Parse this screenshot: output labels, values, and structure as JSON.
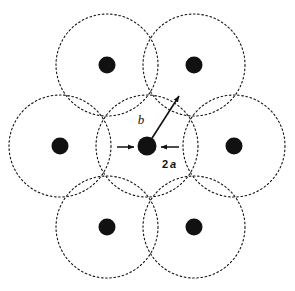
{
  "figure": {
    "background_color": "#ffffff",
    "stroke_color": "#111111",
    "dot_fill_color": "#111111"
  },
  "geometry": {
    "cell_radius": 51,
    "dot_radius": 8.5,
    "dash_pattern": "1.6 2.6",
    "circle_stroke_width": 1.1
  },
  "circles": [
    {
      "name": "circle-top-left",
      "cx": 107,
      "cy": 65,
      "r": 51
    },
    {
      "name": "circle-top-right",
      "cx": 194,
      "cy": 65,
      "r": 51
    },
    {
      "name": "circle-middle-left",
      "cx": 60,
      "cy": 146,
      "r": 51
    },
    {
      "name": "circle-center",
      "cx": 147,
      "cy": 146,
      "r": 51
    },
    {
      "name": "circle-middle-right",
      "cx": 234,
      "cy": 146,
      "r": 51
    },
    {
      "name": "circle-bottom-left",
      "cx": 107,
      "cy": 227,
      "r": 51
    },
    {
      "name": "circle-bottom-right",
      "cx": 194,
      "cy": 227,
      "r": 51
    }
  ],
  "dots": [
    {
      "name": "dot-top-left",
      "cx": 107,
      "cy": 65,
      "r": 8.5
    },
    {
      "name": "dot-top-right",
      "cx": 194,
      "cy": 65,
      "r": 8.5
    },
    {
      "name": "dot-middle-left",
      "cx": 60,
      "cy": 146,
      "r": 8.5
    },
    {
      "name": "dot-center",
      "cx": 147,
      "cy": 146,
      "r": 9.5
    },
    {
      "name": "dot-middle-right",
      "cx": 234,
      "cy": 146,
      "r": 8.5
    },
    {
      "name": "dot-bottom-left",
      "cx": 107,
      "cy": 227,
      "r": 8.5
    },
    {
      "name": "dot-bottom-right",
      "cx": 194,
      "cy": 227,
      "r": 8.5
    }
  ],
  "annotations": {
    "radius_arrow": {
      "label": "b",
      "label_x": 141,
      "label_y": 124,
      "from_x": 147,
      "from_y": 146,
      "to_x": 179,
      "to_y": 96
    },
    "diameter_arrows": {
      "label_number": "2",
      "label_variable": "a",
      "label_x": 162,
      "label_y": 168,
      "left_arrow": {
        "from_x": 117,
        "from_y": 147,
        "to_x": 134,
        "to_y": 147
      },
      "right_arrow": {
        "from_x": 179,
        "from_y": 147,
        "to_x": 161,
        "to_y": 147
      }
    }
  }
}
